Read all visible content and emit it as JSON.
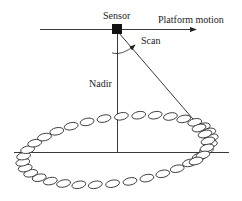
{
  "labels": {
    "sensor": "Sensor",
    "platform_motion": "Platform motion",
    "scan": "Scan",
    "nadir": "Nadir"
  },
  "colors": {
    "line": "#222222",
    "background": "#ffffff"
  }
}
